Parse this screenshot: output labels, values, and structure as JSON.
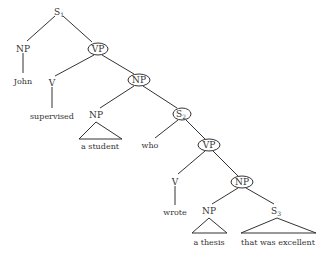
{
  "tree": {
    "s1": {
      "label": "S",
      "sub": "1"
    },
    "np_john": {
      "label": "NP",
      "word": "John"
    },
    "vp1": {
      "label": "VP"
    },
    "v1": {
      "label": "V",
      "word": "supervised"
    },
    "np2": {
      "label": "NP"
    },
    "np_student": {
      "label": "NP",
      "word": "a student"
    },
    "s2": {
      "label": "S",
      "sub": "2"
    },
    "who": {
      "word": "who"
    },
    "vp2": {
      "label": "VP"
    },
    "v2": {
      "label": "V",
      "word": "wrote"
    },
    "np3": {
      "label": "NP"
    },
    "np_thesis": {
      "label": "NP",
      "word": "a thesis"
    },
    "s3": {
      "label": "S",
      "sub": "3",
      "word": "that was excellent"
    }
  }
}
